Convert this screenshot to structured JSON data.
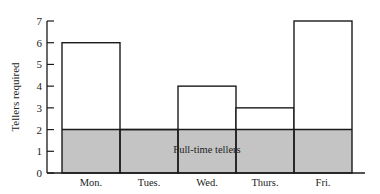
{
  "chart_data": {
    "type": "bar",
    "title": "",
    "xlabel": "",
    "ylabel": "Tellers required",
    "categories": [
      "Mon.",
      "Tues.",
      "Wed.",
      "Thurs.",
      "Fri."
    ],
    "series": [
      {
        "name": "Tellers required",
        "values": [
          6,
          2,
          4,
          3,
          7
        ]
      },
      {
        "name": "Full-time tellers",
        "values": [
          2,
          2,
          2,
          2,
          2
        ]
      }
    ],
    "annotations": [
      {
        "text": "Full-time tellers",
        "region": "shaded band from 0 to 2 across all days"
      }
    ],
    "yticks": [
      0,
      1,
      2,
      3,
      4,
      5,
      6,
      7
    ],
    "ylim": [
      0,
      7
    ],
    "grid": false,
    "legend": "none",
    "colors": {
      "band_fill": "#c4c4c4",
      "bar_fill": "#ffffff",
      "stroke": "#1a1a1a"
    }
  }
}
